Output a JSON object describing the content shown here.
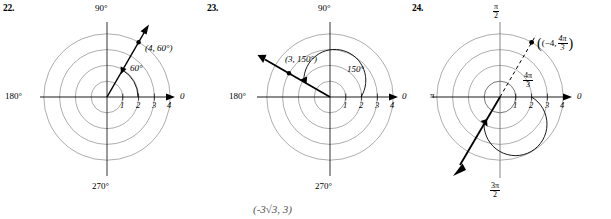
{
  "page": {
    "width": 611,
    "height": 219,
    "background": "#ffffff",
    "grid_circle_color": "#8a8a8a",
    "axis_color": "#000000",
    "ray_color": "#000000",
    "bottom_fragment": "(-3√3, 3)"
  },
  "problems": [
    {
      "number": "22.",
      "type": "polar-plot",
      "angle_units": "degrees",
      "axis_labels": {
        "right": "0",
        "top": "90°",
        "left": "180°",
        "bottom": "270°"
      },
      "radial_ticks": [
        "1",
        "2",
        "3",
        "4"
      ],
      "radial_tick_values": [
        1,
        2,
        3,
        4
      ],
      "circles": [
        1,
        2,
        3,
        4
      ],
      "point_label": "(4, 60°)",
      "point_r": 4,
      "point_theta_deg": 60,
      "angle_arc_label": "60°",
      "ray_theta_deg": 60,
      "ray_style": "solid",
      "ray_extends_past_point": true
    },
    {
      "number": "23.",
      "type": "polar-plot",
      "angle_units": "degrees",
      "axis_labels": {
        "right": "0",
        "top": "90°",
        "left": "180°",
        "bottom": "270°"
      },
      "radial_ticks": [
        "1",
        "2",
        "3",
        "4"
      ],
      "radial_tick_values": [
        1,
        2,
        3,
        4
      ],
      "circles": [
        1,
        2,
        3,
        4
      ],
      "point_label": "(3, 150°)",
      "point_r": 3,
      "point_theta_deg": 150,
      "angle_arc_label": "150°",
      "ray_theta_deg": 150,
      "ray_style": "solid",
      "ray_extends_past_point": true
    },
    {
      "number": "24.",
      "type": "polar-plot",
      "angle_units": "radians",
      "axis_labels": {
        "right": "0",
        "top_num": "π",
        "top_den": "2",
        "left": "π",
        "bottom_num": "3π",
        "bottom_den": "2"
      },
      "radial_ticks": [
        "1",
        "2",
        "3",
        "4"
      ],
      "radial_tick_values": [
        1,
        2,
        3,
        4
      ],
      "circles": [
        1,
        2,
        3,
        4
      ],
      "point_label_prefix": "(−4,",
      "point_label_num": "4π",
      "point_label_den": "3",
      "point_label_suffix": ")",
      "point_r": -4,
      "point_theta_label_num": "4π",
      "point_theta_label_den": "3",
      "angle_arc_label_num": "4π",
      "angle_arc_label_den": "3",
      "ray_theta_deg": 240,
      "ray_style": "solid",
      "dashed_ray_theta_deg": 60,
      "dashed_ray_style": "dashed"
    }
  ]
}
